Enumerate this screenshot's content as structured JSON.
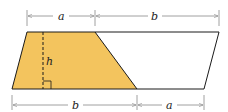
{
  "diagram": {
    "colors": {
      "shaded_fill": "#F3C45E",
      "outline": "#1a1a1a",
      "dimension_line": "#888888",
      "background": "#ffffff"
    },
    "labels": {
      "top_left_segment": "a",
      "top_right_segment": "b",
      "bottom_left_segment": "b",
      "bottom_right_segment": "a",
      "height": "h"
    },
    "shapes": [
      {
        "name": "shaded-trapezoid",
        "fill": "#F3C45E"
      },
      {
        "name": "unshaded-trapezoid",
        "fill": "none"
      }
    ]
  }
}
